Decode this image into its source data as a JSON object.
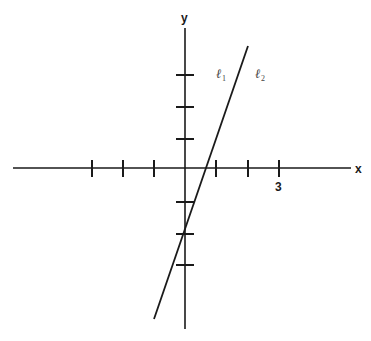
{
  "diagram": {
    "type": "coordinate-plane",
    "axes": {
      "x_label": "x",
      "y_label": "y",
      "unit_px": 31.3,
      "origin_px": [
        185,
        168
      ],
      "x_ticks": [
        -3,
        -2,
        -1,
        1,
        2,
        3
      ],
      "y_ticks": [
        3,
        2,
        1,
        -1,
        -2,
        -3
      ],
      "labeled_tick": {
        "axis": "x",
        "value": 3,
        "text": "3"
      }
    },
    "lines": [
      {
        "label": "ℓ",
        "subscript": "1",
        "description": "line labeled left of drawn line"
      },
      {
        "label": "ℓ",
        "subscript": "2",
        "description": "line labeled right of drawn line"
      }
    ],
    "drawn_line": {
      "equation": "y = 3x - 2",
      "slope": 3,
      "y_intercept": -2,
      "x_intercept": 0.67,
      "endpoints_px": [
        [
          154,
          319
        ],
        [
          248,
          46
        ]
      ]
    },
    "colors": {
      "ink": "#1a1a1a",
      "background": "#ffffff"
    }
  }
}
